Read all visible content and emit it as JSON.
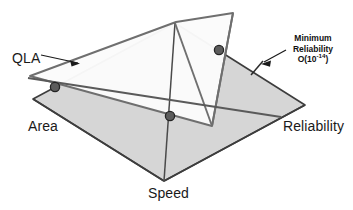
{
  "figure": {
    "labels": {
      "area": "Area",
      "speed": "Speed",
      "reliability": "Reliability",
      "qla": "QLA"
    },
    "callout": {
      "line1": "Minimum",
      "line2": "Reliability",
      "base": "O(10",
      "exponent": "-14",
      "close": ")"
    },
    "colors": {
      "base_plane_fill": "#d6d6d6",
      "qla_plane_fill": "#fbfbfb",
      "base_outline": "#3d3d3d",
      "qla_outline": "#6b6b6b",
      "intersection_line": "#5a5a5a",
      "marker_fill": "#5c5c5c",
      "marker_stroke": "#2b2b2b",
      "text": "#1a1a1a",
      "background": "#ffffff"
    },
    "geometry": {
      "base_plane_vertices": [
        [
          33,
          99
        ],
        [
          175,
          23
        ],
        [
          305,
          105
        ],
        [
          164,
          181
        ]
      ],
      "qla_plane_vertices": [
        [
          30,
          76
        ],
        [
          233,
          13
        ],
        [
          212,
          126
        ],
        [
          176,
          22
        ]
      ],
      "intersection_markers": [
        [
          55,
          87
        ],
        [
          170,
          116
        ],
        [
          219,
          50
        ]
      ],
      "intersection_line": [
        [
          28,
          78
        ],
        [
          282,
          81
        ]
      ],
      "tick_mark": [
        [
          252,
          74
        ],
        [
          262,
          62
        ]
      ],
      "qla_leader": [
        [
          40,
          56
        ],
        [
          82,
          65
        ]
      ],
      "callout_leader": [
        [
          261,
          64
        ],
        [
          287,
          50
        ]
      ]
    }
  }
}
